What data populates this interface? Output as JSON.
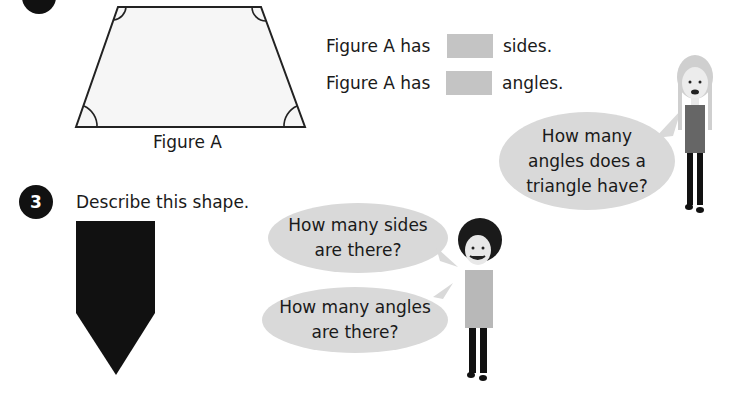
{
  "question2": {
    "figure_label": "Figure A",
    "statements": [
      {
        "prefix": "Figure A has",
        "suffix": "sides."
      },
      {
        "prefix": "Figure A has",
        "suffix": "angles."
      }
    ],
    "girl_speech": "How many angles does a triangle have?"
  },
  "question3": {
    "number": "3",
    "prompt": "Describe this shape.",
    "boy_speech": [
      "How many sides are there?",
      "How many angles are there?"
    ]
  },
  "colors": {
    "blank": "#c4c4c4",
    "bubble": "#d9d9d9",
    "shape": "#111111"
  }
}
